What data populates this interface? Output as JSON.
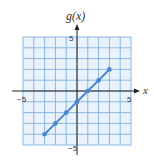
{
  "chart_data": {
    "type": "line",
    "title": "",
    "xlabel": "x",
    "ylabel": "g(x)",
    "xlim": [
      -5,
      5
    ],
    "ylim": [
      -5,
      5
    ],
    "grid": true,
    "x_ticks_labeled": [
      "-5",
      "5"
    ],
    "y_ticks_labeled": [
      "5",
      "-5"
    ],
    "series": [
      {
        "name": "g(x)",
        "x": [
          -3,
          -2,
          -1,
          0,
          1,
          2,
          3
        ],
        "y": [
          -4,
          -3,
          -2,
          -1,
          0,
          1,
          2
        ],
        "color": "#4a86d0"
      }
    ]
  },
  "labels": {
    "y_axis": "g(x)",
    "x_axis": "x",
    "x_min": "−5",
    "x_max": "5",
    "y_max": "5",
    "y_min": "−5"
  },
  "colors": {
    "grid": "#7fb0e0",
    "grid_bg": "#eaf3fb",
    "axis": "#222222",
    "line": "#4a86d0"
  }
}
